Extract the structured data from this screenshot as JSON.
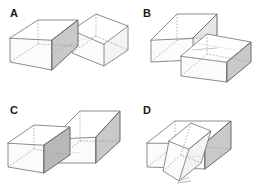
{
  "figure": {
    "background_color": "#ffffff",
    "width": 266,
    "height": 193,
    "panel_count": 4,
    "grid": "2x2"
  },
  "style": {
    "edge_color": "#808080",
    "edge_color_strong": "#6b6b6b",
    "edge_color_faint": "#b5b5b5",
    "hidden_edge_color": "#9a9a9a",
    "face_white": "#ffffff",
    "face_light": "#f3f3f3",
    "face_mid": "#e6e6e6",
    "face_dark": "#c9c9c9",
    "face_darker": "#b8b8b8",
    "label_color": "#1a1a1a"
  },
  "panels": [
    {
      "id": "a",
      "label": "A",
      "label_x": 10,
      "label_y": 17,
      "description": "Two rectangular boxes interpenetrating; left box horizontal, right box rotated, dark shaded wedge face at the junction pointing up-right",
      "shapes": 2
    },
    {
      "id": "b",
      "label": "B",
      "label_x": 10,
      "label_y": 17,
      "description": "Two rectangular boxes interpenetrating; upper-left box tilted back, lower-right box with dark shaded right end face",
      "shapes": 2
    },
    {
      "id": "c",
      "label": "C",
      "label_x": 10,
      "label_y": 17,
      "description": "Two rectangular boxes interpenetrating; left box horizontal, right box angled with dark shaded right end face and shaded lower wedge",
      "shapes": 2
    },
    {
      "id": "d",
      "label": "D",
      "label_x": 10,
      "label_y": 17,
      "description": "Two rectangular boxes interpenetrating; horizontal box with dark shaded right end face, second box plunging downward through it",
      "shapes": 2
    }
  ]
}
